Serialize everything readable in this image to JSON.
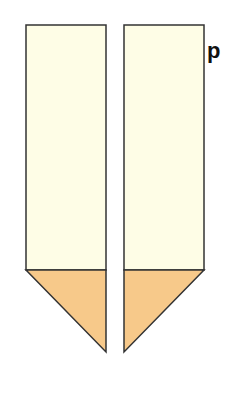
{
  "diagram": {
    "label": "p",
    "colors": {
      "body_fill": "#fefde6",
      "tip_fill": "#f7c98a",
      "stroke": "#333333"
    },
    "shapes": [
      {
        "name": "left-strip",
        "tip_direction": "right"
      },
      {
        "name": "right-strip",
        "tip_direction": "left"
      }
    ]
  }
}
